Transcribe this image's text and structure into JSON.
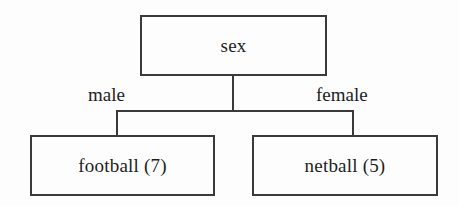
{
  "diagram": {
    "type": "decision-tree",
    "root": {
      "label": "sex"
    },
    "branches": [
      {
        "label": "male",
        "leaf": {
          "label": "football (7)",
          "outcome": "football",
          "count": 7
        }
      },
      {
        "label": "female",
        "leaf": {
          "label": "netball (5)",
          "outcome": "netball",
          "count": 5
        }
      }
    ],
    "colors": {
      "line": "#3a3a3a",
      "text": "#1d1d1d",
      "background": "#fdfdfd"
    }
  }
}
